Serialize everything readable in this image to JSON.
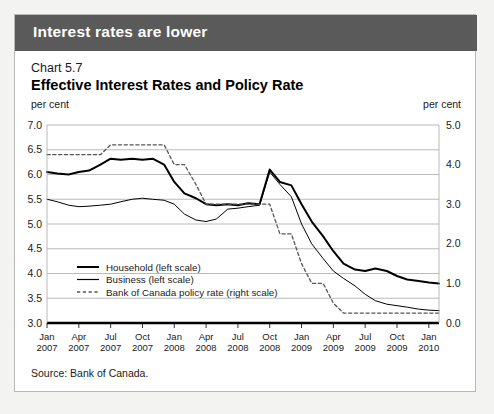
{
  "banner": {
    "text": "Interest rates are lower"
  },
  "header": {
    "chart_number": "Chart 5.7",
    "title": "Effective Interest Rates and Policy Rate",
    "unit_left": "per cent",
    "unit_right": "per cent"
  },
  "footer": {
    "source": "Source: Bank of Canada."
  },
  "chart_data": {
    "type": "line",
    "title": "Effective Interest Rates and Policy Rate",
    "subtitle": "Chart 5.7",
    "xlabel": "",
    "ylabel": "per cent",
    "ylabel_right": "per cent",
    "ylim": [
      3.0,
      7.0
    ],
    "ylim_right": [
      0.0,
      5.0
    ],
    "yticks": [
      "7.0",
      "6.5",
      "6.0",
      "5.5",
      "5.0",
      "4.5",
      "4.0",
      "3.5",
      "3.0"
    ],
    "yticks_right": [
      "5.0",
      "4.0",
      "3.0",
      "2.0",
      "1.0",
      "0.0"
    ],
    "yticks_right_values": [
      5.0,
      4.0,
      3.0,
      2.0,
      1.0,
      0.0
    ],
    "grid": true,
    "legend_position": "inside-left",
    "xticks": [
      {
        "month": "Jan",
        "year": "2007"
      },
      {
        "month": "Apr",
        "year": "2007"
      },
      {
        "month": "Jul",
        "year": "2007"
      },
      {
        "month": "Oct",
        "year": "2007"
      },
      {
        "month": "Jan",
        "year": "2008"
      },
      {
        "month": "Apr",
        "year": "2008"
      },
      {
        "month": "Jul",
        "year": "2008"
      },
      {
        "month": "Oct",
        "year": "2008"
      },
      {
        "month": "Jan",
        "year": "2009"
      },
      {
        "month": "Apr",
        "year": "2009"
      },
      {
        "month": "Jul",
        "year": "2009"
      },
      {
        "month": "Oct",
        "year": "2009"
      },
      {
        "month": "Jan",
        "year": "2010"
      }
    ],
    "x_start": 2007.0,
    "x_end": 2010.08,
    "series": [
      {
        "name": "Household (left scale)",
        "scale": "left",
        "style": "solid",
        "width": 2.0,
        "color": "#000000",
        "x": [
          2007.0,
          2007.08,
          2007.17,
          2007.25,
          2007.33,
          2007.42,
          2007.5,
          2007.58,
          2007.67,
          2007.75,
          2007.83,
          2007.92,
          2008.0,
          2008.08,
          2008.17,
          2008.25,
          2008.33,
          2008.42,
          2008.5,
          2008.58,
          2008.67,
          2008.75,
          2008.83,
          2008.92,
          2009.0,
          2009.08,
          2009.17,
          2009.25,
          2009.33,
          2009.42,
          2009.5,
          2009.58,
          2009.67,
          2009.75,
          2009.83,
          2009.92,
          2010.0,
          2010.08
        ],
        "values": [
          6.05,
          6.02,
          6.0,
          6.05,
          6.08,
          6.2,
          6.32,
          6.3,
          6.32,
          6.3,
          6.32,
          6.2,
          5.85,
          5.62,
          5.52,
          5.4,
          5.38,
          5.4,
          5.38,
          5.42,
          5.4,
          6.1,
          5.85,
          5.78,
          5.4,
          5.05,
          4.75,
          4.45,
          4.2,
          4.08,
          4.05,
          4.1,
          4.05,
          3.95,
          3.88,
          3.85,
          3.82,
          3.8
        ]
      },
      {
        "name": "Business (left scale)",
        "scale": "left",
        "style": "solid",
        "width": 1.0,
        "color": "#000000",
        "x": [
          2007.0,
          2007.08,
          2007.17,
          2007.25,
          2007.33,
          2007.42,
          2007.5,
          2007.58,
          2007.67,
          2007.75,
          2007.83,
          2007.92,
          2008.0,
          2008.08,
          2008.17,
          2008.25,
          2008.33,
          2008.42,
          2008.5,
          2008.58,
          2008.67,
          2008.75,
          2008.83,
          2008.92,
          2009.0,
          2009.08,
          2009.17,
          2009.25,
          2009.33,
          2009.42,
          2009.5,
          2009.58,
          2009.67,
          2009.75,
          2009.83,
          2009.92,
          2010.0,
          2010.08
        ],
        "values": [
          5.5,
          5.45,
          5.38,
          5.35,
          5.36,
          5.38,
          5.4,
          5.45,
          5.5,
          5.52,
          5.5,
          5.48,
          5.4,
          5.2,
          5.08,
          5.05,
          5.1,
          5.3,
          5.32,
          5.35,
          5.38,
          6.05,
          5.8,
          5.55,
          5.0,
          4.6,
          4.3,
          4.05,
          3.9,
          3.75,
          3.58,
          3.45,
          3.38,
          3.35,
          3.32,
          3.28,
          3.26,
          3.25
        ]
      },
      {
        "name": "Bank of Canada policy rate (right scale)",
        "scale": "right",
        "style": "dashed",
        "width": 1.3,
        "color": "#555555",
        "x": [
          2007.0,
          2007.17,
          2007.42,
          2007.5,
          2007.92,
          2008.0,
          2008.08,
          2008.17,
          2008.25,
          2008.33,
          2008.5,
          2008.75,
          2008.83,
          2008.92,
          2009.0,
          2009.08,
          2009.17,
          2009.25,
          2009.33,
          2009.42,
          2009.5,
          2009.75,
          2010.0,
          2010.08
        ],
        "values": [
          4.25,
          4.25,
          4.25,
          4.5,
          4.5,
          4.0,
          4.0,
          3.5,
          3.0,
          3.0,
          3.0,
          3.0,
          2.25,
          2.25,
          1.5,
          1.0,
          1.0,
          0.5,
          0.25,
          0.25,
          0.25,
          0.25,
          0.25,
          0.25
        ]
      }
    ],
    "legend": [
      {
        "label": "Household (left scale)",
        "style": "solid",
        "width": 2.0
      },
      {
        "label": "Business (left scale)",
        "style": "solid",
        "width": 1.2
      },
      {
        "label": "Bank of Canada policy rate (right scale)",
        "style": "dashed",
        "width": 1.3
      }
    ]
  }
}
